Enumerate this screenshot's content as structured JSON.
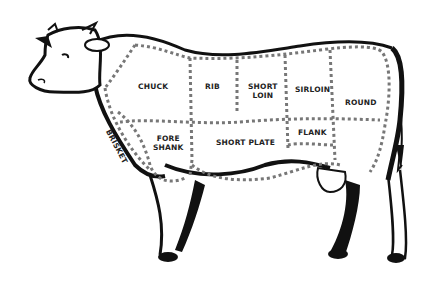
{
  "diagram": {
    "title": "",
    "colors": {
      "outline": "#111111",
      "dots": "#777777",
      "text": "#222222",
      "background": "#ffffff"
    },
    "cuts": [
      {
        "id": "chuck",
        "label": "CHUCK"
      },
      {
        "id": "rib",
        "label": "RIB"
      },
      {
        "id": "short-loin",
        "label": "SHORT\nLOIN",
        "line1": "SHORT",
        "line2": "LOIN"
      },
      {
        "id": "sirloin",
        "label": "SIRLOIN"
      },
      {
        "id": "round",
        "label": "ROUND"
      },
      {
        "id": "brisket",
        "label": "BRISKET"
      },
      {
        "id": "fore-shank",
        "label": "FORE\nSHANK",
        "line1": "FORE",
        "line2": "SHANK"
      },
      {
        "id": "short-plate",
        "label": "SHORT PLATE"
      },
      {
        "id": "flank",
        "label": "FLANK"
      }
    ]
  }
}
